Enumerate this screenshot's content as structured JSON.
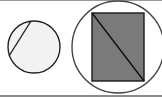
{
  "diagram": {
    "panels": [
      {
        "name": "circle-with-chord",
        "circle": {
          "cx": 34,
          "cy": 47,
          "r": 26,
          "fill": "#f2f2f2",
          "stroke": "#222222"
        },
        "chord": {
          "x1": 31,
          "y1": 21,
          "x2": 9,
          "y2": 56,
          "stroke": "#222222"
        }
      },
      {
        "name": "circle-with-inscribed-rectangle",
        "circle": {
          "cx": 118,
          "cy": 47,
          "r": 46,
          "fill": "#ffffff",
          "stroke": "#444444"
        },
        "rectangle": {
          "x": 92,
          "y": 13,
          "width": 52,
          "height": 68,
          "fill": "#7a7a7a",
          "stroke": "#1a1a1a"
        },
        "diagonal": {
          "x1": 92,
          "y1": 13,
          "x2": 144,
          "y2": 81,
          "stroke": "#111111"
        }
      }
    ],
    "colors": {
      "background": "#ffffff",
      "border": "#9a9a9a"
    }
  }
}
